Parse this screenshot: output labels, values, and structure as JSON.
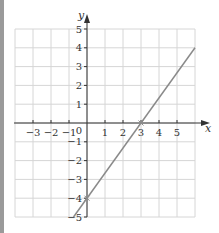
{
  "chart_data": {
    "type": "line",
    "title": "",
    "xlabel": "x",
    "ylabel": "y",
    "xlim": [
      -4,
      6
    ],
    "ylim": [
      -5,
      5
    ],
    "grid": true,
    "x_ticks": [
      "-3",
      "-2",
      "-1",
      "1",
      "2",
      "3",
      "4",
      "5"
    ],
    "y_ticks": [
      "5",
      "4",
      "3",
      "2",
      "1",
      "-1",
      "-2",
      "-3",
      "-4",
      "-5"
    ],
    "origin_label": "0",
    "series": [
      {
        "name": "y = (4/3)x - 4",
        "equation": "y = 4x/3 - 4",
        "x": [
          -0.75,
          6
        ],
        "y": [
          -5,
          4
        ],
        "color": "#8a8a8a"
      }
    ],
    "marked_points": [
      {
        "x": 3,
        "y": 0,
        "label": "x-intercept"
      },
      {
        "x": 0,
        "y": -4,
        "label": "y-intercept"
      }
    ]
  },
  "colors": {
    "grid": "#d6d6d6",
    "axis": "#333333",
    "line": "#8a8a8a",
    "left_bar": "#9a9a9a"
  }
}
